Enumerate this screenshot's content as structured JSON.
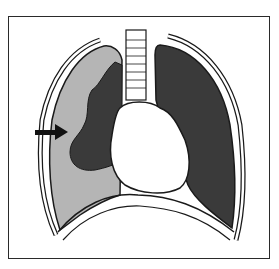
{
  "figure": {
    "colors": {
      "frame": "#2a2a2a",
      "collapsed_lung": "#3a3a3a",
      "normal_lung": "#3a3a3a",
      "pleural_air_space": "#b5b5b5",
      "heart": "#ffffff",
      "outline": "#1a1a1a",
      "arrow": "#111111"
    }
  }
}
